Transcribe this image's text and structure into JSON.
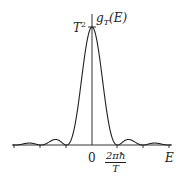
{
  "chart_data": {
    "type": "line",
    "title": "",
    "xlabel": "E",
    "ylabel": "g_T(E)",
    "y_peak_label": "T²",
    "x_tick_labels": [
      "0",
      "2πħ/T"
    ],
    "function": "g_T(E) = T² · sinc²(E T / 2ħ)",
    "x_units": "multiples of 2πħ/T",
    "x": [
      -3,
      -2.5,
      -2,
      -1.5,
      -1,
      -0.5,
      0,
      0.5,
      1,
      1.5,
      2,
      2.5,
      3
    ],
    "values_rel_T2": [
      0,
      0.016,
      0,
      0.045,
      0,
      0.405,
      1,
      0.405,
      0,
      0.045,
      0,
      0.016,
      0
    ],
    "zeros_at": [
      -3,
      -2,
      -1,
      1,
      2,
      3
    ],
    "xlim": [
      -3.1,
      3.1
    ],
    "ylim": [
      0,
      1
    ],
    "grid": false,
    "legend": "none",
    "series_color": "#222222"
  },
  "labels": {
    "y_axis": "g",
    "y_axis_sub": "T",
    "y_axis_arg": "(E)",
    "peak": "T",
    "peak_sup": "2",
    "origin": "0",
    "tick_num": "2πħ",
    "tick_den": "T",
    "x_axis": "E"
  }
}
